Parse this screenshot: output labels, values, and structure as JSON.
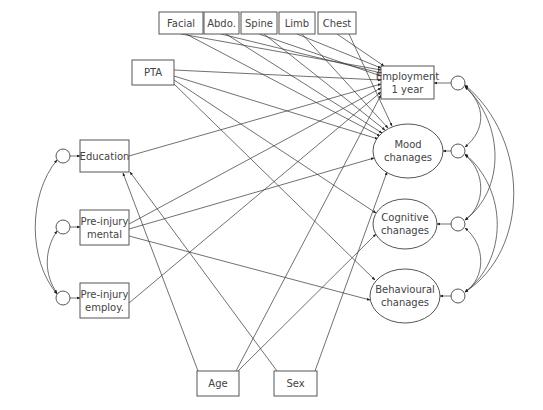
{
  "diagram": {
    "type": "structural-equation-model",
    "nodes": {
      "facial": {
        "label": "Facial",
        "shape": "rect",
        "x": 159,
        "y": 12,
        "w": 44,
        "h": 22
      },
      "abdo": {
        "label": "Abdo.",
        "shape": "rect",
        "x": 204,
        "y": 12,
        "w": 35,
        "h": 22
      },
      "spine": {
        "label": "Spine",
        "shape": "rect",
        "x": 241,
        "y": 12,
        "w": 36,
        "h": 22
      },
      "limb": {
        "label": "Limb",
        "shape": "rect",
        "x": 279,
        "y": 12,
        "w": 36,
        "h": 22
      },
      "chest": {
        "label": "Chest",
        "shape": "rect",
        "x": 318,
        "y": 12,
        "w": 38,
        "h": 22
      },
      "pta": {
        "label": "PTA",
        "shape": "rect",
        "x": 132,
        "y": 60,
        "w": 42,
        "h": 25
      },
      "education": {
        "label": "Education",
        "shape": "rect",
        "x": 80,
        "y": 140,
        "w": 49,
        "h": 32
      },
      "preinjury_mental": {
        "label_line1": "Pre-injury",
        "label_line2": "mental",
        "shape": "rect",
        "x": 80,
        "y": 210,
        "w": 49,
        "h": 35
      },
      "preinjury_employ": {
        "label_line1": "Pre-injury",
        "label_line2": "employ.",
        "shape": "rect",
        "x": 80,
        "y": 283,
        "w": 49,
        "h": 35
      },
      "age": {
        "label": "Age",
        "shape": "rect",
        "x": 197,
        "y": 371,
        "w": 42,
        "h": 25
      },
      "sex": {
        "label": "Sex",
        "shape": "rect",
        "x": 274,
        "y": 371,
        "w": 43,
        "h": 25
      },
      "employment": {
        "label_line1": "Employment",
        "label_line2": "1 year",
        "shape": "rect",
        "x": 381,
        "y": 66,
        "w": 53,
        "h": 33
      },
      "mood": {
        "label_line1": "Mood",
        "label_line2": "chanages",
        "shape": "ellipse",
        "cx": 408,
        "cy": 151,
        "rx": 35,
        "ry": 27
      },
      "cognitive": {
        "label_line1": "Cognitive",
        "label_line2": "chanages",
        "shape": "ellipse",
        "cx": 405,
        "cy": 224,
        "rx": 32,
        "ry": 25
      },
      "behavioural": {
        "label_line1": "Behavioural",
        "label_line2": "chanages",
        "shape": "ellipse",
        "cx": 405,
        "cy": 296,
        "rx": 35,
        "ry": 27
      }
    },
    "error_terms_left": [
      {
        "target": "education",
        "cx": 63,
        "cy": 156
      },
      {
        "target": "preinjury_mental",
        "cx": 63,
        "cy": 227
      },
      {
        "target": "preinjury_employ",
        "cx": 63,
        "cy": 298
      }
    ],
    "error_terms_right": [
      {
        "target": "employment",
        "cx": 458,
        "cy": 83
      },
      {
        "target": "mood",
        "cx": 458,
        "cy": 151
      },
      {
        "target": "cognitive",
        "cx": 458,
        "cy": 224
      },
      {
        "target": "behavioural",
        "cx": 458,
        "cy": 296
      }
    ],
    "paths": [
      [
        "facial",
        "employment"
      ],
      [
        "facial",
        "mood"
      ],
      [
        "abdo",
        "employment"
      ],
      [
        "abdo",
        "mood"
      ],
      [
        "spine",
        "employment"
      ],
      [
        "spine",
        "mood"
      ],
      [
        "limb",
        "employment"
      ],
      [
        "limb",
        "mood"
      ],
      [
        "chest",
        "employment"
      ],
      [
        "chest",
        "mood"
      ],
      [
        "pta",
        "employment"
      ],
      [
        "pta",
        "mood"
      ],
      [
        "pta",
        "cognitive"
      ],
      [
        "pta",
        "behavioural"
      ],
      [
        "education",
        "employment"
      ],
      [
        "preinjury_mental",
        "employment"
      ],
      [
        "preinjury_mental",
        "mood"
      ],
      [
        "preinjury_mental",
        "behavioural"
      ],
      [
        "preinjury_employ",
        "employment"
      ],
      [
        "age",
        "education"
      ],
      [
        "age",
        "employment"
      ],
      [
        "age",
        "cognitive"
      ],
      [
        "sex",
        "education"
      ],
      [
        "sex",
        "mood"
      ]
    ],
    "covariances_left": [
      [
        "education",
        "preinjury_employ"
      ],
      [
        "preinjury_mental",
        "preinjury_employ"
      ]
    ],
    "covariances_right": [
      [
        "employment",
        "mood"
      ],
      [
        "employment",
        "cognitive"
      ],
      [
        "employment",
        "behavioural"
      ],
      [
        "mood",
        "cognitive"
      ],
      [
        "mood",
        "behavioural"
      ],
      [
        "cognitive",
        "behavioural"
      ]
    ]
  }
}
